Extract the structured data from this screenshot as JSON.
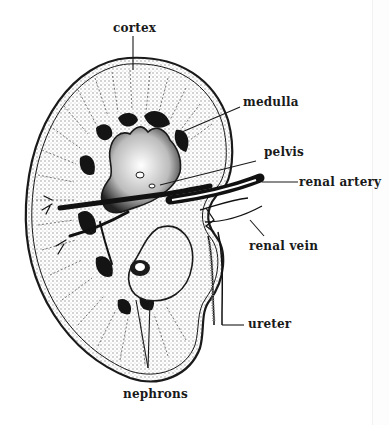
{
  "figure": {
    "labels": {
      "cortex": "cortex",
      "medulla": "medulla",
      "pelvis": "pelvis",
      "renal_artery": "renal artery",
      "renal_vein": "renal vein",
      "ureter": "ureter",
      "nephrons": "nephrons"
    }
  },
  "colors": {
    "ink": "#1a1a1a",
    "paper": "#ffffff",
    "stipple": "#d9d9d9"
  }
}
